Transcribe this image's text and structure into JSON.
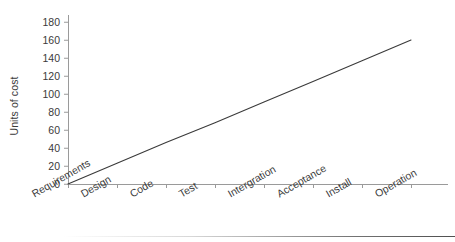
{
  "chart_data": {
    "type": "line",
    "title": "",
    "xlabel": "",
    "ylabel": "Units of cost",
    "categories": [
      "Requirements",
      "Design",
      "Code",
      "Test",
      "Intergration",
      "Acceptance",
      "Install",
      "Operation"
    ],
    "values": [
      0,
      23,
      46,
      68,
      91,
      114,
      137,
      160
    ],
    "ylim": [
      0,
      180
    ],
    "y_ticks": [
      0,
      20,
      40,
      60,
      80,
      100,
      120,
      140,
      160,
      180
    ],
    "grid": false,
    "legend": false,
    "series": [
      {
        "name": "Cost of change",
        "values": [
          0,
          23,
          46,
          68,
          91,
          114,
          137,
          160
        ]
      }
    ],
    "line_color": "#3a3a3a",
    "axis_color": "#9a9a9a"
  }
}
